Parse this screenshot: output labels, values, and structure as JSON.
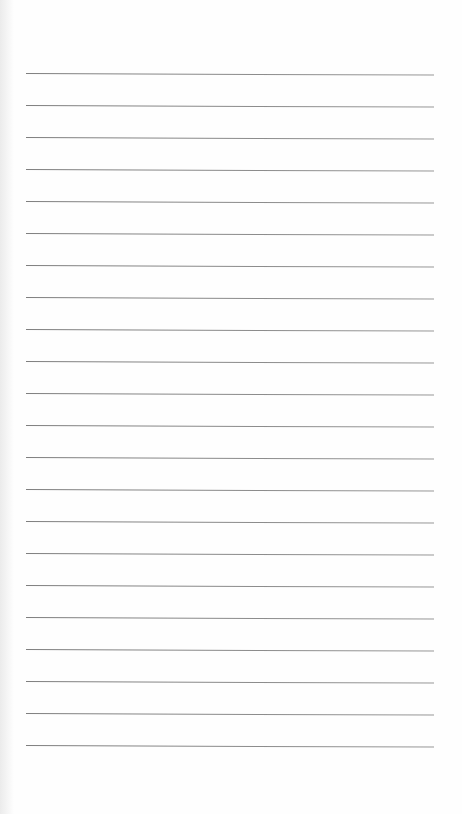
{
  "page": {
    "type": "lined-notepaper",
    "background_color": "#ffffff",
    "line_color": "#8a8a8a",
    "line_count": 22,
    "line_left_px": 26,
    "line_right_px": 434,
    "first_line_y": 73,
    "line_spacing_px": 32,
    "content_text": ""
  },
  "lines": [
    {
      "y": 73
    },
    {
      "y": 105
    },
    {
      "y": 137
    },
    {
      "y": 169
    },
    {
      "y": 201
    },
    {
      "y": 233
    },
    {
      "y": 265
    },
    {
      "y": 297
    },
    {
      "y": 329
    },
    {
      "y": 361
    },
    {
      "y": 393
    },
    {
      "y": 425
    },
    {
      "y": 457
    },
    {
      "y": 489
    },
    {
      "y": 521
    },
    {
      "y": 553
    },
    {
      "y": 585
    },
    {
      "y": 617
    },
    {
      "y": 649
    },
    {
      "y": 681
    },
    {
      "y": 713
    },
    {
      "y": 745
    }
  ]
}
